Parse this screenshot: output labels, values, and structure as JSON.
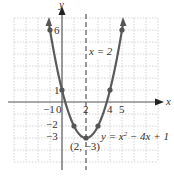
{
  "chart_data": {
    "type": "line",
    "title": "",
    "equation": "y = x^2 - 4x + 1",
    "equation_label": "y = x² − 4x + 1",
    "axis_of_symmetry_label": "x = 2",
    "vertex_label": "(2, −3)",
    "xlabel": "x",
    "ylabel": "y",
    "xlim": [
      -4,
      8
    ],
    "ylim": [
      -5,
      7
    ],
    "grid": true,
    "x_tick_labels": [
      "−1",
      "0",
      "2",
      "4",
      "5"
    ],
    "y_tick_labels": [
      "6",
      "1",
      "−2",
      "−3"
    ],
    "points": [
      {
        "x": -1,
        "y": 6
      },
      {
        "x": 0,
        "y": 1
      },
      {
        "x": 1,
        "y": -2
      },
      {
        "x": 2,
        "y": -3
      },
      {
        "x": 3,
        "y": -2
      },
      {
        "x": 4,
        "y": 1
      },
      {
        "x": 5,
        "y": 6
      }
    ],
    "series": [
      {
        "name": "y = x^2 - 4x + 1",
        "x": [
          -1,
          0,
          1,
          2,
          3,
          4,
          5
        ],
        "values": [
          6,
          1,
          -2,
          -3,
          -2,
          1,
          6
        ]
      }
    ],
    "axis_of_symmetry": 2,
    "vertex": {
      "x": 2,
      "y": -3
    }
  },
  "labels": {
    "x_axis": "x",
    "y_axis": "y",
    "six": "6",
    "one": "1",
    "neg_two": "−2",
    "neg_three": "−3",
    "neg_one": "−1",
    "zero": "0",
    "two": "2",
    "four": "4",
    "five": "5",
    "sym": "x = 2",
    "vertex": "(2, −3)",
    "eq_prefix": "y = x",
    "eq_exp": "2",
    "eq_suffix": " − 4x + 1"
  },
  "colors": {
    "curve": "#555555",
    "axis": "#555555",
    "grid": "#c8c8c8",
    "text": "#333333"
  }
}
